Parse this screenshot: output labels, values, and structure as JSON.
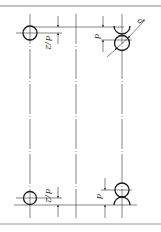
{
  "diagram": {
    "type": "technical-drawing",
    "colors": {
      "background": "#ffffff",
      "line": "#1a1a1a",
      "thin_line": "#333333",
      "border": "#888888"
    },
    "labels": {
      "top_left_dim": "d/2",
      "top_right_vertical_dim": "d",
      "top_right_diagonal_dim": "d",
      "bottom_left_dim": "d/2",
      "bottom_right_vertical_dim": "d"
    },
    "fraction": {
      "numerator": "d",
      "denominator": "2"
    }
  }
}
